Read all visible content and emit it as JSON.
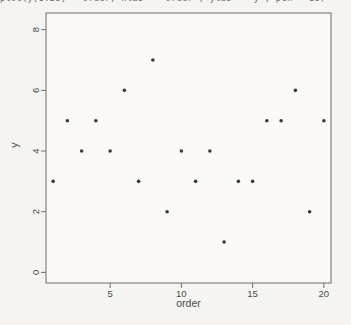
{
  "page": {
    "background": "#f5f4f1"
  },
  "top_clipped_line": "plot(y[1:20] ~ order, xlab = \"order\", ylab = \"y\", pch = 16)",
  "chart_data": {
    "type": "scatter",
    "title": "",
    "xlabel": "order",
    "ylabel": "y",
    "x": [
      1,
      2,
      3,
      4,
      5,
      6,
      7,
      8,
      9,
      10,
      11,
      12,
      13,
      14,
      15,
      16,
      17,
      18,
      19,
      20
    ],
    "y": [
      3,
      5,
      4,
      5,
      4,
      6,
      3,
      7,
      2,
      4,
      3,
      4,
      1,
      3,
      3,
      5,
      5,
      6,
      2,
      5
    ],
    "xlim": [
      0.5,
      20.5
    ],
    "ylim": [
      -0.35,
      8.55
    ],
    "xticks": [
      5,
      10,
      15,
      20
    ],
    "yticks": [
      0,
      2,
      4,
      6,
      8
    ],
    "y_tick_labels_rotated": true,
    "grid": false,
    "legend": "none",
    "point_color": "#3a3a38",
    "axis_color": "#6e6d6a",
    "label_color": "#4a4a48",
    "plot_bg": "#faf9f6"
  }
}
